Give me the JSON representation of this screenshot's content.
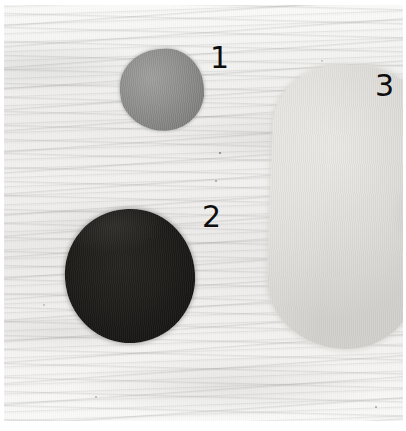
{
  "image": {
    "kind": "specimen-photograph",
    "description": "Three numbered sample fragments photographed on a white textured fibrous background",
    "width": 406,
    "height": 431,
    "background": {
      "name": "textured-white-surface",
      "color": "#f2f2f0",
      "texture": "horizontal fibrous streaks with fine vertical scan lines"
    },
    "frame": {
      "border_color": "#ffffff",
      "margin_top": 5,
      "margin_left": 4,
      "margin_right": 3,
      "margin_bottom": 10
    }
  },
  "specimens": [
    {
      "label": "1",
      "name": "specimen-1",
      "shape": "rounded teardrop blob",
      "color": "#8a8a89",
      "tone": "medium gray",
      "bbox": {
        "x": 116,
        "y": 44,
        "width": 84,
        "height": 82
      },
      "callout": {
        "x": 206,
        "y": 38
      }
    },
    {
      "label": "2",
      "name": "specimen-2",
      "shape": "irregular circle",
      "color": "#1c1b18",
      "tone": "near black",
      "bbox": {
        "x": 61,
        "y": 204,
        "width": 130,
        "height": 134
      },
      "callout": {
        "x": 198,
        "y": 197
      }
    },
    {
      "label": "3",
      "name": "specimen-3",
      "shape": "large elongated rounded blob",
      "color": "#e0dedA",
      "tone": "very light gray",
      "bbox": {
        "x": 266,
        "y": 60,
        "width": 140,
        "height": 284
      },
      "callout": {
        "x": 371,
        "y": 66
      }
    }
  ],
  "callout_style": {
    "color": "#0d0d0d",
    "font_size_px": 30
  }
}
